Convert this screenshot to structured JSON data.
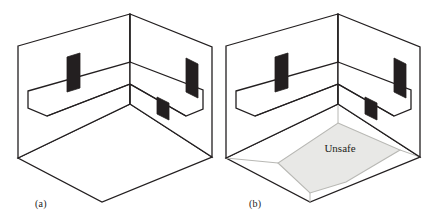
{
  "figure": {
    "background_color": "#ffffff",
    "line_color": "#231f20",
    "opening_fill": "#231f20",
    "unsafe_fill": "#e8e8e6",
    "unsafe_stroke": "#b8b8b4",
    "panels": [
      {
        "id": "a",
        "caption": "(a)",
        "description": "Room with three dark wall openings and a ledge, no unsafe region",
        "openings": 3,
        "has_unsafe_region": false
      },
      {
        "id": "b",
        "caption": "(b)",
        "description": "Room with three dark wall openings, a ledge, and a shaded unsafe floor region",
        "openings": 3,
        "has_unsafe_region": true,
        "region_label": "Unsafe"
      }
    ],
    "labels": {
      "unsafe": "Unsafe"
    }
  }
}
